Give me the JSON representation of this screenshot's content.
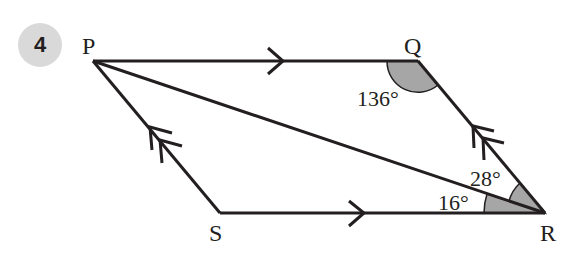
{
  "question": {
    "number": "4"
  },
  "diagram": {
    "shape": "parallelogram",
    "vertices": [
      {
        "name": "P",
        "x": 93,
        "y": 61
      },
      {
        "name": "Q",
        "x": 418,
        "y": 61
      },
      {
        "name": "R",
        "x": 545,
        "y": 213
      },
      {
        "name": "S",
        "x": 220,
        "y": 213
      }
    ],
    "labels": {
      "P": "P",
      "Q": "Q",
      "R": "R",
      "S": "S"
    },
    "diagonal": "PR",
    "angles": {
      "Q": "136°",
      "PRQ": "28°",
      "PRS": "16°"
    },
    "parallel_marks": {
      "PQ": "single-arrow",
      "SR": "single-arrow",
      "SP": "double-arrow",
      "RQ": "double-arrow"
    },
    "colors": {
      "line": "#231f20",
      "shade": "#a6a6a6",
      "badge": "#d9d9d9"
    }
  }
}
